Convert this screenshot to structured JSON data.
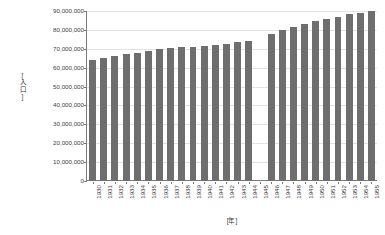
{
  "chart_data": {
    "type": "bar",
    "title": "",
    "subtitle": "",
    "xlabel": "[年]",
    "ylabel": "[人口]",
    "ylim": [
      0,
      90000000
    ],
    "ytick_step": 10000000,
    "grid": true,
    "legend": false,
    "bar_color": "#6e6e6e",
    "gridline_color": "#e2e2e2",
    "axis_color": "#7a7a7a",
    "background_color": "#ffffff",
    "note": "1945 has no bar (missing data)",
    "categories": [
      "1930",
      "1931",
      "1932",
      "1933",
      "1934",
      "1935",
      "1936",
      "1937",
      "1938",
      "1939",
      "1940",
      "1941",
      "1942",
      "1943",
      "1944",
      "1945",
      "1946",
      "1947",
      "1948",
      "1949",
      "1950",
      "1951",
      "1952",
      "1953",
      "1954",
      "1955"
    ],
    "values": [
      64000000,
      64900000,
      66000000,
      67000000,
      68000000,
      69000000,
      69900000,
      70300000,
      70800000,
      71000000,
      71700000,
      71900000,
      72500000,
      73500000,
      74000000,
      null,
      78000000,
      79900000,
      81700000,
      83200000,
      84500000,
      85900000,
      87000000,
      88200000,
      89200000,
      90000000
    ],
    "ytick_labels": [
      "90,000,000",
      "80,000,000",
      "70,000,000",
      "60,000,000",
      "50,000,000",
      "40,000,000",
      "30,000,000",
      "20,000,000",
      "10,000,000",
      "0"
    ],
    "ytick_values": [
      90000000,
      80000000,
      70000000,
      60000000,
      50000000,
      40000000,
      30000000,
      20000000,
      10000000,
      0
    ]
  }
}
